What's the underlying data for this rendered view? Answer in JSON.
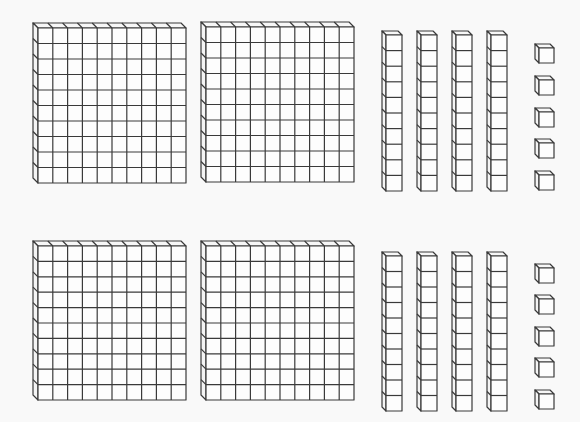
{
  "diagram": {
    "type": "base-ten-blocks",
    "colors": {
      "background": "#f9f9f9",
      "stroke": "#3a3a3a",
      "fill": "#fdfdfd"
    },
    "groups": [
      {
        "name": "top-group",
        "hundreds": 2,
        "tens": 4,
        "ones": 5,
        "value": 245,
        "flats": [
          {
            "x": 38,
            "y": 28,
            "w": 148,
            "h": 155,
            "cols": 10,
            "rows": 10,
            "depth": 5
          },
          {
            "x": 206,
            "y": 27,
            "w": 148,
            "h": 155,
            "cols": 10,
            "rows": 10,
            "depth": 5
          }
        ],
        "rods": [
          {
            "x": 386,
            "y": 35,
            "w": 16,
            "h": 156,
            "cells": 10,
            "depth": 4
          },
          {
            "x": 421,
            "y": 35,
            "w": 16,
            "h": 156,
            "cells": 10,
            "depth": 4
          },
          {
            "x": 456,
            "y": 35,
            "w": 16,
            "h": 156,
            "cells": 10,
            "depth": 4
          },
          {
            "x": 491,
            "y": 35,
            "w": 16,
            "h": 156,
            "cells": 10,
            "depth": 4
          }
        ],
        "units": [
          {
            "x": 539,
            "y": 48,
            "s": 15,
            "depth": 4
          },
          {
            "x": 539,
            "y": 80,
            "s": 15,
            "depth": 4
          },
          {
            "x": 539,
            "y": 112,
            "s": 15,
            "depth": 4
          },
          {
            "x": 539,
            "y": 143,
            "s": 15,
            "depth": 4
          },
          {
            "x": 539,
            "y": 175,
            "s": 15,
            "depth": 4
          }
        ]
      },
      {
        "name": "bottom-group",
        "hundreds": 2,
        "tens": 4,
        "ones": 5,
        "value": 245,
        "flats": [
          {
            "x": 38,
            "y": 246,
            "w": 148,
            "h": 154,
            "cols": 10,
            "rows": 10,
            "depth": 5
          },
          {
            "x": 206,
            "y": 246,
            "w": 148,
            "h": 154,
            "cols": 10,
            "rows": 10,
            "depth": 5
          }
        ],
        "rods": [
          {
            "x": 386,
            "y": 256,
            "w": 16,
            "h": 155,
            "cells": 10,
            "depth": 4
          },
          {
            "x": 421,
            "y": 256,
            "w": 16,
            "h": 155,
            "cells": 10,
            "depth": 4
          },
          {
            "x": 456,
            "y": 256,
            "w": 16,
            "h": 155,
            "cells": 10,
            "depth": 4
          },
          {
            "x": 491,
            "y": 256,
            "w": 16,
            "h": 155,
            "cells": 10,
            "depth": 4
          }
        ],
        "units": [
          {
            "x": 539,
            "y": 268,
            "s": 15,
            "depth": 4
          },
          {
            "x": 539,
            "y": 299,
            "s": 15,
            "depth": 4
          },
          {
            "x": 539,
            "y": 331,
            "s": 15,
            "depth": 4
          },
          {
            "x": 539,
            "y": 362,
            "s": 15,
            "depth": 4
          },
          {
            "x": 539,
            "y": 394,
            "s": 15,
            "depth": 4
          }
        ]
      }
    ]
  }
}
